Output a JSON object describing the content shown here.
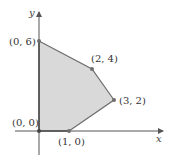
{
  "figure": {
    "type": "feasible-region",
    "axes": {
      "x_label": "x",
      "y_label": "y"
    },
    "colors": {
      "fill": "#d9d9d9",
      "edge": "#6e6e6e",
      "axis": "#555555",
      "point": "#6e6e6e"
    },
    "vertices": [
      {
        "label": "(0, 0)",
        "x": 0,
        "y": 0
      },
      {
        "label": "(1, 0)",
        "x": 1,
        "y": 0
      },
      {
        "label": "(3, 2)",
        "x": 3,
        "y": 2
      },
      {
        "label": "(2, 4)",
        "x": 2,
        "y": 4
      },
      {
        "label": "(0, 6)",
        "x": 0,
        "y": 6
      }
    ]
  }
}
